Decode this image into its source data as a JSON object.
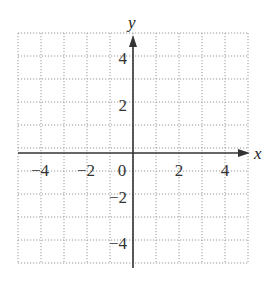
{
  "chart_data": {
    "type": "coordinate-grid",
    "title": "",
    "xlabel": "x",
    "ylabel": "y",
    "xlim": [
      -5,
      5
    ],
    "ylim": [
      -5,
      5
    ],
    "grid": true,
    "grid_style": "dotted",
    "x_tick_labels": [
      "-4",
      "-2",
      "0",
      "2",
      "4"
    ],
    "y_tick_labels": [
      "4",
      "2",
      "-2",
      "-4"
    ],
    "x_tick_values": [
      -4,
      -2,
      0,
      2,
      4
    ],
    "y_tick_values": [
      4,
      2,
      -2,
      -4
    ],
    "series": []
  },
  "labels": {
    "x_axis": "x",
    "y_axis": "y",
    "x_ticks": [
      "−4",
      "−2",
      "0",
      "2",
      "4"
    ],
    "y_ticks": [
      "4",
      "2",
      "−2",
      "−4"
    ]
  },
  "colors": {
    "axis": "#333333",
    "grid": "#9a9a9a"
  }
}
